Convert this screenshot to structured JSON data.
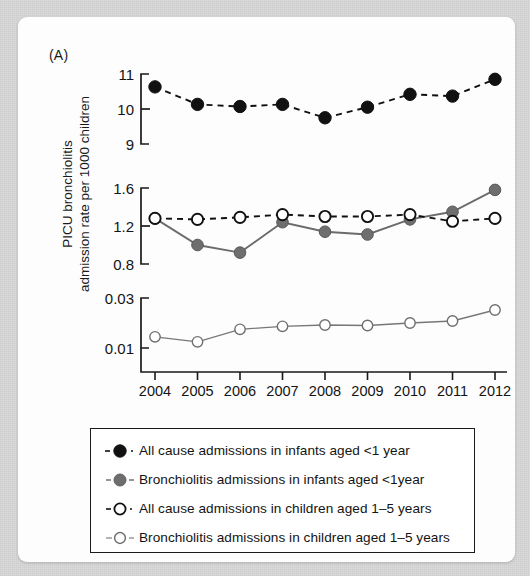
{
  "figure": {
    "panel_letter": "(A)",
    "y_axis_title_line1": "PICU bronchiolitis",
    "y_axis_title_line2": "admission rate per 1000 children"
  },
  "legend": {
    "items": [
      {
        "label": "All cause admissions in infants aged <1 year",
        "marker": "filled-black-circle-marker",
        "color": "#111111",
        "fill": "#111111"
      },
      {
        "label": "Bronchiolitis admissions in infants aged <1year",
        "marker": "filled-gray-circle-marker",
        "color": "#6b6b6b",
        "fill": "#6b6b6b"
      },
      {
        "label": "All cause admissions in children aged 1–5 years",
        "marker": "open-black-circle-marker",
        "color": "#111111",
        "fill": "#ffffff"
      },
      {
        "label": "Bronchiolitis admissions in children aged 1–5 years",
        "marker": "open-gray-circle-marker",
        "color": "#777777",
        "fill": "#ffffff"
      }
    ]
  },
  "chart_data": {
    "type": "line",
    "title": "",
    "xlabel": "",
    "ylabel": "PICU bronchiolitis admission rate per 1000 children",
    "x": [
      2004,
      2005,
      2006,
      2007,
      2008,
      2009,
      2010,
      2011,
      2012
    ],
    "categories": [
      "2004",
      "2005",
      "2006",
      "2007",
      "2008",
      "2009",
      "2010",
      "2011",
      "2012"
    ],
    "grid": false,
    "legend_position": "below-plot",
    "broken_axis": true,
    "panels": [
      {
        "name": "top-panel",
        "ylim": [
          9,
          11
        ],
        "yticks": [
          9,
          10,
          11
        ],
        "ytick_labels": [
          "9",
          "10",
          "11"
        ],
        "series": [
          {
            "name": "All cause admissions in infants aged <1 year",
            "marker": "filled-black-circle-marker",
            "linestyle": "dashed",
            "color": "#111111",
            "values": [
              10.63,
              10.13,
              10.07,
              10.13,
              9.75,
              10.05,
              10.42,
              10.37,
              10.85
            ]
          }
        ]
      },
      {
        "name": "middle-panel",
        "ylim": [
          0.8,
          1.6
        ],
        "yticks": [
          0.8,
          1.2,
          1.6
        ],
        "ytick_labels": [
          "0.8",
          "1.2",
          "1.6"
        ],
        "series": [
          {
            "name": "Bronchiolitis admissions in infants aged <1year",
            "marker": "filled-gray-circle-marker",
            "linestyle": "solid",
            "color": "#6b6b6b",
            "values": [
              1.28,
              1.0,
              0.92,
              1.24,
              1.14,
              1.11,
              1.27,
              1.35,
              1.58
            ]
          },
          {
            "name": "All cause admissions in children aged 1–5 years",
            "marker": "open-black-circle-marker",
            "linestyle": "dashed",
            "color": "#111111",
            "values": [
              1.28,
              1.27,
              1.29,
              1.32,
              1.3,
              1.3,
              1.32,
              1.25,
              1.28
            ]
          }
        ]
      },
      {
        "name": "bottom-panel",
        "ylim": [
          0.004,
          0.032
        ],
        "yticks": [
          0.01,
          0.03
        ],
        "ytick_labels": [
          "0.01",
          "0.03"
        ],
        "series": [
          {
            "name": "Bronchiolitis admissions in children aged 1–5 years",
            "marker": "open-gray-circle-marker",
            "linestyle": "solid",
            "color": "#777777",
            "values": [
              0.0145,
              0.0125,
              0.0175,
              0.0187,
              0.0192,
              0.019,
              0.02,
              0.0208,
              0.0252
            ]
          }
        ]
      }
    ]
  }
}
